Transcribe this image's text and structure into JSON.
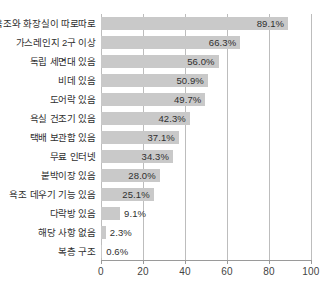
{
  "chart_data": {
    "type": "bar",
    "orientation": "horizontal",
    "title": "",
    "xlabel": "",
    "ylabel": "",
    "xlim": [
      0,
      100
    ],
    "xticks": [
      0,
      20,
      40,
      60,
      80,
      100
    ],
    "xtick_labels": [
      "0",
      "20",
      "40",
      "60",
      "80",
      "100"
    ],
    "grid": true,
    "legend": false,
    "bar_color": "#c9c9c9",
    "value_suffix": "%",
    "categories": [
      "욕조와 화장실이 따로따로",
      "가스레인지 2구 이상",
      "독립 세면대 있음",
      "비데 있음",
      "도어락 있음",
      "욕실 건조기 있음",
      "택배 보관함 있음",
      "무료 인터넷",
      "붙박이장 있음",
      "욕조 데우기 기능 있음",
      "다락방 있음",
      "해당 사항 없음",
      "복층 구조"
    ],
    "values": [
      89.1,
      66.3,
      56.0,
      50.9,
      49.7,
      42.3,
      37.1,
      34.3,
      28.0,
      25.1,
      9.1,
      2.3,
      0.6
    ],
    "value_labels": [
      "89.1%",
      "66.3%",
      "56.0%",
      "50.9%",
      "49.7%",
      "42.3%",
      "37.1%",
      "34.3%",
      "28.0%",
      "25.1%",
      "9.1%",
      "2.3%",
      "0.6%"
    ]
  }
}
